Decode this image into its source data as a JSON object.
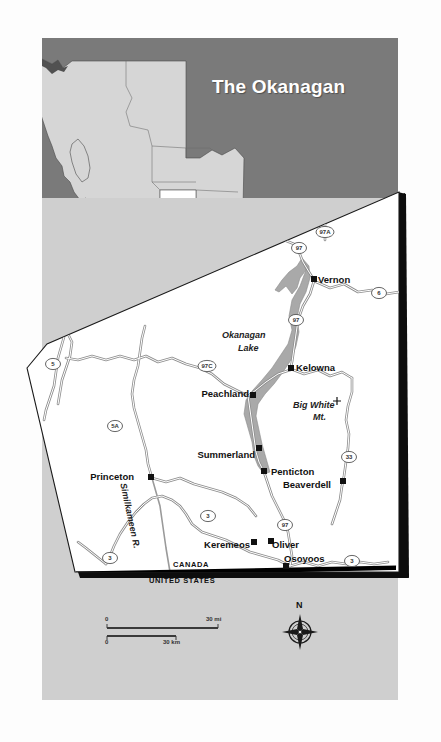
{
  "page": {
    "title": "The Okanagan",
    "background_color": "#ffffff",
    "paper_color": "#cfcfcf",
    "header_color": "#7a7a7a",
    "land_color": "#ffffff",
    "water_color": "#a9a9a9",
    "border_color": "#000000"
  },
  "inset": {
    "name": "british-columbia-locator",
    "province_fill": "#d4d4d4",
    "highlight_fill": "#ffffff",
    "ocean_fill": "#7a7a7a"
  },
  "cities": [
    {
      "name": "Vernon",
      "label": "Vernon",
      "x": 318,
      "y": 280,
      "anchor": "left"
    },
    {
      "name": "Kelowna",
      "label": "Kelowna",
      "x": 296,
      "y": 368,
      "anchor": "left"
    },
    {
      "name": "Peachland",
      "label": "Peachland",
      "x": 249,
      "y": 394,
      "anchor": "right"
    },
    {
      "name": "Summerland",
      "label": "Summerland",
      "x": 255,
      "y": 455,
      "anchor": "right"
    },
    {
      "name": "Penticton",
      "label": "Penticton",
      "x": 271,
      "y": 472,
      "anchor": "left"
    },
    {
      "name": "Beaverdell",
      "label": "Beaverdell",
      "x": 331,
      "y": 485,
      "anchor": "right"
    },
    {
      "name": "Princeton",
      "label": "Princeton",
      "x": 134,
      "y": 477,
      "anchor": "right"
    },
    {
      "name": "Keremeos",
      "label": "Keremeos",
      "x": 250,
      "y": 545,
      "anchor": "right"
    },
    {
      "name": "Oliver",
      "label": "Oliver",
      "x": 272,
      "y": 545,
      "anchor": "left"
    },
    {
      "name": "Osoyoos",
      "label": "Osoyoos",
      "x": 284,
      "y": 559,
      "anchor": "left"
    }
  ],
  "features": {
    "lake": "Okanagan Lake",
    "lake_line1": "Okanagan",
    "lake_line2": "Lake",
    "peak_line1": "Big White",
    "peak_line2": "Mt.",
    "peak_marker": "+",
    "river": "Similkameen R."
  },
  "highways": [
    {
      "id": "97A",
      "x": 325,
      "y": 232
    },
    {
      "id": "97",
      "x": 299,
      "y": 248
    },
    {
      "id": "6",
      "x": 379,
      "y": 293
    },
    {
      "id": "97",
      "x": 296,
      "y": 320
    },
    {
      "id": "97C",
      "x": 207,
      "y": 366
    },
    {
      "id": "5",
      "x": 53,
      "y": 364
    },
    {
      "id": "5A",
      "x": 115,
      "y": 426
    },
    {
      "id": "33",
      "x": 349,
      "y": 457
    },
    {
      "id": "3",
      "x": 208,
      "y": 516
    },
    {
      "id": "97",
      "x": 285,
      "y": 525
    },
    {
      "id": "3",
      "x": 110,
      "y": 558
    },
    {
      "id": "3",
      "x": 352,
      "y": 561
    }
  ],
  "border": {
    "north_label": "CANADA",
    "south_label": "UNITED STATES"
  },
  "scale_bar": {
    "miles": {
      "start": "0",
      "end": "30 mi"
    },
    "kilometres": {
      "start": "0",
      "end": "30 km"
    }
  },
  "compass": {
    "north_label": "N"
  }
}
